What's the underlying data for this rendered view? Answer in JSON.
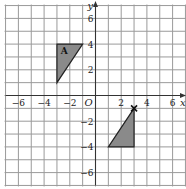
{
  "diagram": {
    "type": "coordinate-grid",
    "axes": {
      "x_label": "x",
      "y_label": "y",
      "origin_label": "O",
      "range": [
        -7,
        7
      ],
      "x_ticks": [
        "−6",
        "−4",
        "−2",
        "2",
        "4",
        "6"
      ],
      "y_ticks": [
        "6",
        "4",
        "2",
        "−2",
        "−4",
        "−6"
      ]
    },
    "shapes": [
      {
        "name": "triangle-A",
        "label": "A",
        "vertices": [
          [
            -3,
            4
          ],
          [
            -1,
            4
          ],
          [
            -3,
            1
          ]
        ],
        "fill": "#8a8a8a"
      },
      {
        "name": "triangle-image",
        "label": "",
        "vertices": [
          [
            3,
            -1
          ],
          [
            3,
            -4
          ],
          [
            1,
            -4
          ]
        ],
        "fill": "#8a8a8a"
      }
    ],
    "marker": {
      "name": "cross-marker",
      "symbol": "×",
      "point": [
        3,
        -1
      ]
    }
  }
}
